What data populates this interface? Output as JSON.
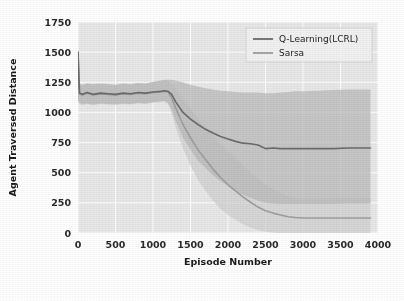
{
  "chart_data": {
    "type": "line",
    "title": "",
    "xlabel": "Episode Number",
    "ylabel": "Agent Traversed Distance",
    "xlim": [
      0,
      4000
    ],
    "ylim": [
      0,
      1750
    ],
    "xticks": [
      0,
      500,
      1000,
      1500,
      2000,
      2500,
      3000,
      3500,
      4000
    ],
    "yticks": [
      0,
      250,
      500,
      750,
      1000,
      1250,
      1500,
      1750
    ],
    "xtick_labels": [
      "0",
      "500",
      "1000",
      "1500",
      "2000",
      "2500",
      "3000",
      "3500",
      "4000"
    ],
    "ytick_labels": [
      "0",
      "250",
      "500",
      "750",
      "1000",
      "1250",
      "1500",
      "1750"
    ],
    "grid": true,
    "grid_color": "#ffffff",
    "plot_background": "#e8e8e8",
    "figure_background": "#ffffff",
    "legend_position": "top-right",
    "series": [
      {
        "name": "Q-Learning(LCRL)",
        "color": "#6b6b6b",
        "band_color": "#b9b9b9",
        "x": [
          0,
          20,
          60,
          120,
          200,
          300,
          400,
          500,
          600,
          700,
          800,
          900,
          1000,
          1100,
          1150,
          1200,
          1250,
          1300,
          1400,
          1500,
          1600,
          1700,
          1800,
          1900,
          2000,
          2100,
          2200,
          2300,
          2400,
          2500,
          2600,
          2700,
          2800,
          2900,
          3000,
          3200,
          3400,
          3600,
          3800,
          3900
        ],
        "values": [
          1500,
          1160,
          1150,
          1165,
          1150,
          1160,
          1155,
          1150,
          1160,
          1155,
          1165,
          1160,
          1170,
          1175,
          1180,
          1175,
          1150,
          1090,
          1000,
          945,
          900,
          860,
          830,
          800,
          780,
          760,
          745,
          740,
          730,
          700,
          705,
          700,
          700,
          700,
          700,
          700,
          700,
          705,
          705,
          705
        ],
        "band_lower": [
          1100,
          1080,
          1070,
          1075,
          1065,
          1075,
          1070,
          1070,
          1075,
          1070,
          1080,
          1075,
          1085,
          1090,
          1095,
          1080,
          1020,
          930,
          790,
          690,
          600,
          540,
          480,
          430,
          390,
          350,
          320,
          290,
          270,
          250,
          245,
          240,
          240,
          240,
          240,
          240,
          240,
          245,
          245,
          245
        ],
        "band_upper": [
          1280,
          1240,
          1230,
          1240,
          1235,
          1240,
          1235,
          1230,
          1240,
          1235,
          1245,
          1240,
          1255,
          1265,
          1270,
          1270,
          1270,
          1265,
          1250,
          1230,
          1215,
          1200,
          1190,
          1180,
          1175,
          1170,
          1165,
          1165,
          1165,
          1160,
          1160,
          1165,
          1170,
          1175,
          1175,
          1180,
          1185,
          1190,
          1190,
          1190
        ]
      },
      {
        "name": "Sarsa",
        "color": "#9e9e9e",
        "band_color": "#cfcfcf",
        "x": [
          0,
          20,
          60,
          120,
          200,
          300,
          400,
          500,
          600,
          700,
          800,
          900,
          1000,
          1100,
          1150,
          1200,
          1250,
          1300,
          1400,
          1500,
          1600,
          1700,
          1800,
          1900,
          2000,
          2100,
          2200,
          2300,
          2400,
          2500,
          2600,
          2700,
          2800,
          2900,
          3000,
          3200,
          3400,
          3600,
          3800,
          3900
        ],
        "values": [
          1500,
          1155,
          1145,
          1160,
          1145,
          1155,
          1150,
          1145,
          1155,
          1150,
          1160,
          1155,
          1165,
          1170,
          1175,
          1170,
          1120,
          1040,
          900,
          790,
          690,
          610,
          530,
          460,
          400,
          350,
          300,
          255,
          215,
          185,
          165,
          150,
          135,
          128,
          125,
          125,
          125,
          125,
          125,
          125
        ],
        "band_lower": [
          1090,
          1070,
          1060,
          1070,
          1060,
          1070,
          1065,
          1060,
          1070,
          1065,
          1075,
          1070,
          1080,
          1085,
          1090,
          1070,
          990,
          880,
          700,
          560,
          440,
          350,
          270,
          200,
          150,
          110,
          70,
          45,
          25,
          10,
          5,
          0,
          0,
          0,
          0,
          0,
          0,
          0,
          0,
          0
        ],
        "band_upper": [
          1275,
          1235,
          1225,
          1235,
          1230,
          1235,
          1230,
          1225,
          1235,
          1230,
          1240,
          1235,
          1250,
          1260,
          1265,
          1260,
          1240,
          1200,
          1110,
          1030,
          950,
          880,
          810,
          740,
          680,
          620,
          560,
          500,
          450,
          400,
          360,
          330,
          305,
          290,
          285,
          285,
          290,
          290,
          290,
          290
        ]
      }
    ]
  }
}
